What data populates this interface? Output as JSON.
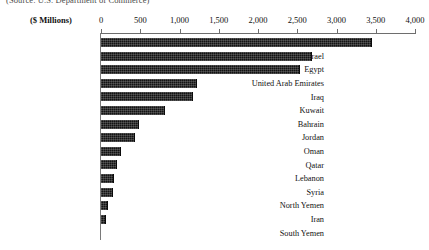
{
  "source_note": "(Source: U.S. Department of Commerce)",
  "units_label": "($ Millions)",
  "chart_data": {
    "type": "bar",
    "orientation": "horizontal",
    "title": "",
    "subtitle": "",
    "xlabel": "($ Millions)",
    "ylabel": "",
    "xlim": [
      0,
      4000
    ],
    "xticks": [
      0,
      500,
      1000,
      1500,
      2000,
      2500,
      3000,
      3500,
      4000
    ],
    "xtick_labels": [
      "0",
      "500",
      "1,000",
      "1,500",
      "2,000",
      "2,500",
      "3,000",
      "3,500",
      "4,000"
    ],
    "grid": false,
    "legend": null,
    "bar_color": "#131313",
    "categories": [
      "Saudi Arabia",
      "Israel",
      "Egypt",
      "United Arab Emirates",
      "Iraq",
      "Kuwait",
      "Bahrain",
      "Jordan",
      "Oman",
      "Qatar",
      "Lebanon",
      "Syria",
      "North Yemen",
      "Iran",
      "South Yemen"
    ],
    "values": [
      3450,
      2690,
      2540,
      1220,
      1170,
      815,
      485,
      430,
      255,
      200,
      165,
      150,
      90,
      65,
      0
    ]
  }
}
